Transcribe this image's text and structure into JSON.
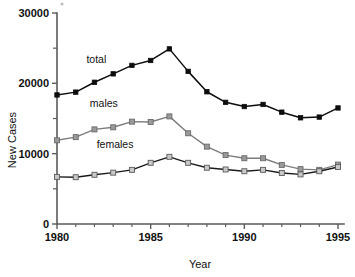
{
  "chart_data": {
    "type": "line",
    "title": "",
    "xlabel": "Year",
    "ylabel": "New Cases",
    "xlim": [
      1980,
      1995
    ],
    "ylim": [
      0,
      30000
    ],
    "grid": false,
    "legend_position": "inline-annotations",
    "x": [
      1980,
      1981,
      1982,
      1983,
      1984,
      1985,
      1986,
      1987,
      1988,
      1989,
      1990,
      1991,
      1992,
      1993,
      1994,
      1995
    ],
    "xticks": [
      1980,
      1985,
      1990,
      1995
    ],
    "xticklabels": [
      "1980",
      "1985",
      "1990",
      "1995"
    ],
    "xminorticks": [
      1981,
      1982,
      1983,
      1984,
      1986,
      1987,
      1988,
      1989,
      1991,
      1992,
      1993,
      1994
    ],
    "yticks": [
      0,
      10000,
      20000,
      30000
    ],
    "yticklabels": [
      "0",
      "10000",
      "20000",
      "30000"
    ],
    "yminorticks": [
      5000,
      15000,
      25000
    ],
    "series": [
      {
        "name": "total",
        "label": "total",
        "color": "#0d0d0d",
        "marker": "filled-square",
        "values": [
          18350,
          18750,
          20150,
          21350,
          22550,
          23250,
          24900,
          21700,
          18800,
          17300,
          16700,
          17000,
          15900,
          15100,
          15200,
          16500
        ]
      },
      {
        "name": "males",
        "label": "males",
        "color": "#9a9a9a",
        "marker": "gray-square",
        "values": [
          11900,
          12350,
          13450,
          13750,
          14550,
          14500,
          15300,
          12900,
          11000,
          9800,
          9350,
          9350,
          8400,
          7800,
          7700,
          8450
        ]
      },
      {
        "name": "females",
        "label": "females",
        "color": "#c9c9c9",
        "marker": "light-square",
        "values": [
          6700,
          6650,
          7000,
          7300,
          7700,
          8700,
          9550,
          8700,
          8000,
          7750,
          7500,
          7700,
          7250,
          7050,
          7500,
          8100
        ]
      }
    ],
    "annotations": [
      {
        "text": "total",
        "x": 1982.1,
        "y": 22900
      },
      {
        "text": "males",
        "x": 1982.5,
        "y": 16600
      },
      {
        "text": "females",
        "x": 1983.1,
        "y": 10800
      }
    ]
  }
}
